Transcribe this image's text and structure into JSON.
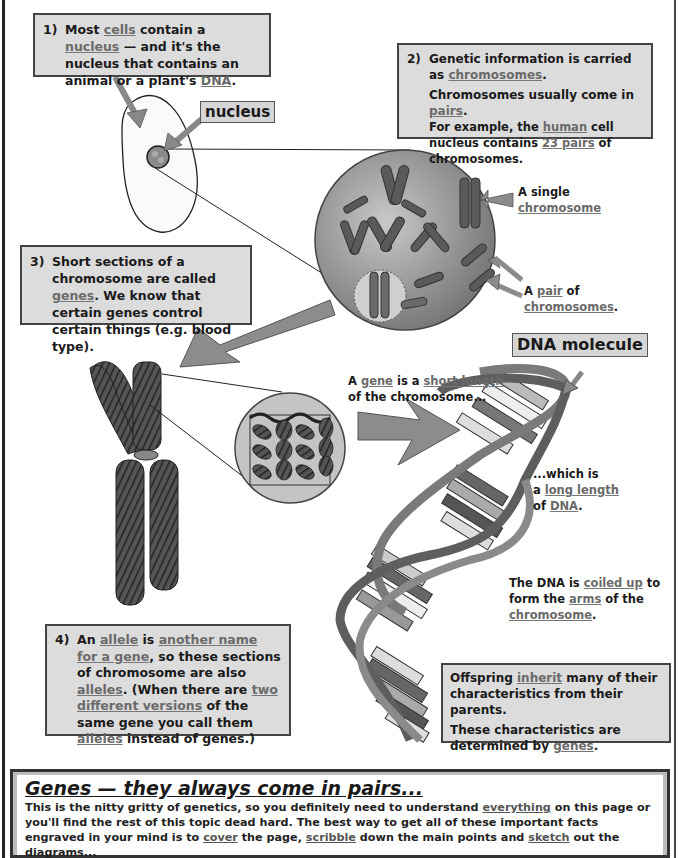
{
  "box1": {
    "number": "1)",
    "parts": [
      "Most ",
      "cells",
      " contain a ",
      "nucleus",
      " — and it's the nucleus that contains an animal or a plant's ",
      "DNA",
      "."
    ]
  },
  "box2": {
    "number": "2)",
    "line1_parts": [
      "Genetic information is carried as ",
      "chromosomes",
      "."
    ],
    "line2_parts": [
      "Chromosomes usually come in ",
      "pairs",
      "."
    ],
    "line3_parts": [
      "For example, the ",
      "human",
      " cell nucleus contains ",
      "23 pairs",
      " of chromosomes."
    ]
  },
  "box3": {
    "number": "3)",
    "parts": [
      "Short sections of a chromosome are called ",
      "genes",
      ".  We know that certain genes control certain things (e.g. blood type)."
    ]
  },
  "box4": {
    "number": "4)",
    "parts": [
      "An ",
      "allele",
      " is ",
      "another name for a gene",
      ", so these sections of chromosome are also ",
      "alleles",
      ". (When there are ",
      "two different versions",
      " of the same gene you call them ",
      "alleles",
      " instead of genes.)"
    ]
  },
  "box5": {
    "line1_parts": [
      "Offspring ",
      "inherit",
      " many of their characteristics from their parents."
    ],
    "line2_parts": [
      "These characteristics are determined by ",
      "genes",
      "."
    ]
  },
  "labels": {
    "nucleus_tag": "nucleus",
    "dna_molecule_tag": "DNA molecule",
    "single_chromosome": [
      "A single",
      "chromosome"
    ],
    "pair_of_chromosomes": [
      "A ",
      "pair",
      " of",
      "chromosomes",
      "."
    ],
    "gene_short_length": [
      "A ",
      "gene",
      " is a ",
      "short length",
      "of the chromosome..."
    ],
    "long_length": [
      "...which is",
      "a ",
      "long length",
      "of ",
      "DNA",
      "."
    ],
    "coiled_up": [
      "The DNA is ",
      "coiled up",
      " to",
      "form the ",
      "arms",
      " of the",
      "chromosome",
      "."
    ]
  },
  "summary": {
    "title": "Genes — they always come in pairs...",
    "parts": [
      "This is the nitty gritty of genetics, so you definitely need to understand ",
      "everything",
      " on this page or you'll find the rest of this topic dead hard.  The best way to get all of these important facts engraved in your mind is to ",
      "cover",
      " the page, ",
      "scribble",
      " down the main points and ",
      "sketch",
      " out the diagrams..."
    ]
  },
  "colors": {
    "box_fill": "#dcdcdc",
    "arrow_fill": "#8c8c8c",
    "underline_text": "#6a6a6a"
  }
}
